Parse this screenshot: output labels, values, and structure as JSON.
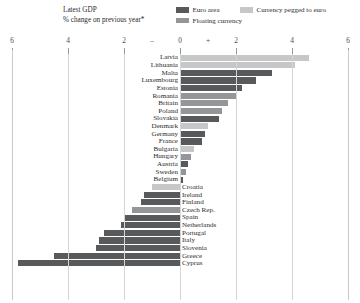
{
  "header": {
    "title": "Latest GDP",
    "subtitle": "% change on previous year*"
  },
  "legend": {
    "items": [
      {
        "label": "Euro area",
        "color": "#58595b",
        "key": "euro"
      },
      {
        "label": "Currency pegged to euro",
        "color": "#c6c7c9",
        "key": "pegged"
      },
      {
        "label": "Floating currency",
        "color": "#949699",
        "key": "floating"
      }
    ]
  },
  "axis": {
    "tick_labels": [
      "6",
      "4",
      "2",
      "–",
      "0",
      "+",
      "2",
      "4",
      "6"
    ],
    "tick_values": [
      -6,
      -4,
      -2,
      -1,
      0,
      1,
      2,
      4,
      6
    ],
    "min": -6,
    "max": 6,
    "zero": 0,
    "gridlines": [
      -4,
      -2,
      0,
      2,
      4
    ]
  },
  "colors": {
    "euro": "#58595b",
    "pegged": "#c6c7c9",
    "floating": "#949699",
    "grid": "#d5d5d5",
    "frame": "#c9c9c9",
    "text": "#2b2b2b"
  },
  "chart_data": {
    "type": "bar",
    "orientation": "horizontal",
    "title": "Latest GDP",
    "subtitle": "% change on previous year*",
    "xlabel": "",
    "ylabel": "",
    "xlim": [
      -6,
      6
    ],
    "grid": true,
    "legend_position": "top-right",
    "tick_labels": [
      "6",
      "4",
      "2",
      "–",
      "0",
      "+",
      "2",
      "4",
      "6"
    ],
    "series_definitions": [
      {
        "name": "Euro area",
        "color": "#58595b"
      },
      {
        "name": "Currency pegged to euro",
        "color": "#c6c7c9"
      },
      {
        "name": "Floating currency",
        "color": "#949699"
      }
    ],
    "categories": [
      "Latvia",
      "Lithuania",
      "Malta",
      "Luxembourg",
      "Estonia",
      "Romania",
      "Britain",
      "Poland",
      "Slovakia",
      "Denmark",
      "Germany",
      "France",
      "Bulgaria",
      "Hungary",
      "Austria",
      "Sweden",
      "Belgium",
      "Croatia",
      "Ireland",
      "Finland",
      "Czech Rep.",
      "Spain",
      "Netherlands",
      "Portugal",
      "Italy",
      "Slovenia",
      "Greece",
      "Cyprus"
    ],
    "values": [
      4.6,
      4.1,
      3.3,
      2.7,
      2.2,
      2.0,
      1.7,
      1.5,
      1.4,
      1.0,
      0.9,
      0.8,
      0.5,
      0.4,
      0.3,
      0.2,
      0.1,
      -1.0,
      -1.3,
      -1.4,
      -1.7,
      -2.0,
      -2.1,
      -2.7,
      -2.9,
      -3.0,
      -4.5,
      -5.8
    ],
    "points": [
      {
        "country": "Latvia",
        "value": 4.6,
        "series": "pegged"
      },
      {
        "country": "Lithuania",
        "value": 4.1,
        "series": "pegged"
      },
      {
        "country": "Malta",
        "value": 3.3,
        "series": "euro"
      },
      {
        "country": "Luxembourg",
        "value": 2.7,
        "series": "euro"
      },
      {
        "country": "Estonia",
        "value": 2.2,
        "series": "euro"
      },
      {
        "country": "Romania",
        "value": 2.0,
        "series": "floating"
      },
      {
        "country": "Britain",
        "value": 1.7,
        "series": "floating"
      },
      {
        "country": "Poland",
        "value": 1.5,
        "series": "floating"
      },
      {
        "country": "Slovakia",
        "value": 1.4,
        "series": "euro"
      },
      {
        "country": "Denmark",
        "value": 1.0,
        "series": "pegged"
      },
      {
        "country": "Germany",
        "value": 0.9,
        "series": "euro"
      },
      {
        "country": "France",
        "value": 0.8,
        "series": "euro"
      },
      {
        "country": "Bulgaria",
        "value": 0.5,
        "series": "pegged"
      },
      {
        "country": "Hungary",
        "value": 0.4,
        "series": "floating"
      },
      {
        "country": "Austria",
        "value": 0.3,
        "series": "euro"
      },
      {
        "country": "Sweden",
        "value": 0.2,
        "series": "floating"
      },
      {
        "country": "Belgium",
        "value": 0.1,
        "series": "euro"
      },
      {
        "country": "Croatia",
        "value": -1.0,
        "series": "pegged"
      },
      {
        "country": "Ireland",
        "value": -1.3,
        "series": "euro"
      },
      {
        "country": "Finland",
        "value": -1.4,
        "series": "euro"
      },
      {
        "country": "Czech Rep.",
        "value": -1.7,
        "series": "floating"
      },
      {
        "country": "Spain",
        "value": -2.0,
        "series": "euro"
      },
      {
        "country": "Netherlands",
        "value": -2.1,
        "series": "euro"
      },
      {
        "country": "Portugal",
        "value": -2.7,
        "series": "euro"
      },
      {
        "country": "Italy",
        "value": -2.9,
        "series": "euro"
      },
      {
        "country": "Slovenia",
        "value": -3.0,
        "series": "euro"
      },
      {
        "country": "Greece",
        "value": -4.5,
        "series": "euro"
      },
      {
        "country": "Cyprus",
        "value": -5.8,
        "series": "euro"
      }
    ]
  }
}
